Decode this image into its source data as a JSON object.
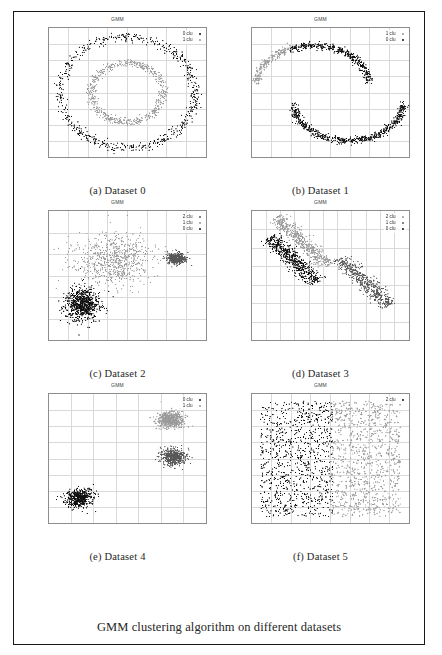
{
  "figure": {
    "caption": "GMM clustering algorithm on different datasets",
    "subplot_title": "GMM",
    "axis_label_x": "x",
    "axis_label_y": "y"
  },
  "subfigures": [
    {
      "caption": "(a) Dataset 0"
    },
    {
      "caption": "(b) Dataset 1"
    },
    {
      "caption": "(c) Dataset 2"
    },
    {
      "caption": "(d) Dataset 3"
    },
    {
      "caption": "(e) Dataset 4"
    },
    {
      "caption": "(f) Dataset 5"
    }
  ],
  "colors": {
    "cluster0": "#101010",
    "cluster1": "#9a9a9a",
    "cluster2": "#585858",
    "grid": "#d9d9d9",
    "frame": "#8d8d8d",
    "border": "#17171a",
    "text": "#262626"
  },
  "chart_data": [
    {
      "id": "a",
      "type": "scatter",
      "title": "GMM",
      "xlabel": "x",
      "ylabel": "y",
      "xlim": [
        -2,
        2
      ],
      "ylim": [
        -2,
        2
      ],
      "xticks": [
        "-2",
        "-1.5",
        "-1",
        "-0.5",
        "0",
        "0.5",
        "1",
        "1.5",
        "2"
      ],
      "yticks": [
        "-2",
        "-1.5",
        "-1",
        "-0.5",
        "0",
        "0.5",
        "1",
        "1.5",
        "2"
      ],
      "grid": true,
      "legend_position": "top-right",
      "shape": "concentric-circles",
      "series": [
        {
          "name": "0 clu",
          "color": "#101010",
          "n": 600,
          "radius": 1.72,
          "noise": 0.075,
          "marker": "dot"
        },
        {
          "name": "1 clu",
          "color": "#9a9a9a",
          "n": 600,
          "radius": 0.92,
          "noise": 0.062,
          "marker": "dot"
        }
      ]
    },
    {
      "id": "b",
      "type": "scatter",
      "title": "GMM",
      "xlabel": "x",
      "ylabel": "y",
      "xlim": [
        -2,
        2
      ],
      "ylim": [
        -2,
        2
      ],
      "xticks": [
        "-2",
        "-1.5",
        "-1",
        "-0.5",
        "0",
        "0.5",
        "1",
        "1.5",
        "2"
      ],
      "yticks": [
        "-2",
        "-1.5",
        "-1",
        "-0.5",
        "0",
        "0.5",
        "1",
        "1.5",
        "2"
      ],
      "grid": true,
      "legend_position": "top-right",
      "shape": "two-moons",
      "series": [
        {
          "name": "1 clu",
          "color": "#9a9a9a",
          "n": 230,
          "marker": "plus"
        },
        {
          "name": "0 clu",
          "color": "#101010",
          "n": 1000,
          "marker": "dot"
        }
      ]
    },
    {
      "id": "c",
      "type": "scatter",
      "title": "GMM",
      "xlabel": "x",
      "ylabel": "y",
      "xlim": [
        -2,
        2
      ],
      "ylim": [
        -3,
        3
      ],
      "xticks": [
        "-2",
        "-1.5",
        "-1",
        "-0.5",
        "0",
        "0.5",
        "1",
        "1.5",
        "2"
      ],
      "yticks": [
        "-3",
        "-2",
        "-1",
        "0",
        "1",
        "2",
        "3"
      ],
      "grid": true,
      "legend_position": "top-right",
      "shape": "three-blobs",
      "series": [
        {
          "name": "2 clu",
          "color": "#585858",
          "n": 420,
          "cx": 1.25,
          "cy": 0.78,
          "sx": 0.12,
          "sy": 0.13,
          "marker": "dot"
        },
        {
          "name": "1 clu",
          "color": "#9a9a9a",
          "n": 700,
          "cx": -0.35,
          "cy": 0.72,
          "sx": 0.52,
          "sy": 0.62,
          "marker": "dot"
        },
        {
          "name": "0 clu",
          "color": "#101010",
          "n": 750,
          "cx": -1.15,
          "cy": -1.35,
          "sx": 0.22,
          "sy": 0.38,
          "marker": "dot"
        }
      ]
    },
    {
      "id": "d",
      "type": "scatter",
      "title": "GMM",
      "xlabel": "x",
      "ylabel": "y",
      "xlim": [
        -2.5,
        3
      ],
      "ylim": [
        -4,
        3
      ],
      "xticks": [
        "-2.5",
        "-2",
        "-1.5",
        "-1",
        "-0.5",
        "0",
        "0.5",
        "1",
        "1.5",
        "2",
        "2.5",
        "3"
      ],
      "yticks": [
        "-4",
        "-3",
        "-2",
        "-1",
        "0",
        "1",
        "2",
        "3"
      ],
      "grid": true,
      "legend_position": "top-right",
      "shape": "anisotropic-bands",
      "series": [
        {
          "name": "2 clu",
          "color": "#9a9a9a",
          "n": 520,
          "cx": -0.75,
          "cy": 1.35,
          "len": 1.6,
          "slope": -1.45,
          "width": 0.16,
          "marker": "dot"
        },
        {
          "name": "1 clu",
          "color": "#585858",
          "n": 520,
          "cx": 1.45,
          "cy": -0.85,
          "len": 1.55,
          "slope": -1.45,
          "width": 0.17,
          "marker": "dot"
        },
        {
          "name": "0 clu",
          "color": "#101010",
          "n": 560,
          "cx": -1.05,
          "cy": 0.35,
          "len": 1.5,
          "slope": -1.45,
          "width": 0.17,
          "marker": "dot"
        }
      ]
    },
    {
      "id": "e",
      "type": "scatter",
      "title": "GMM",
      "xlabel": "x",
      "ylabel": "y",
      "xlim": [
        -2,
        1.5
      ],
      "ylim": [
        -2,
        2
      ],
      "xticks": [
        "-2",
        "-1.5",
        "-1",
        "-0.5",
        "0",
        "0.5",
        "1",
        "1.5"
      ],
      "yticks": [
        "-2",
        "-1.5",
        "-1",
        "-0.5",
        "0",
        "0.5",
        "1",
        "1.5",
        "2"
      ],
      "grid": true,
      "legend_position": "top-right",
      "shape": "three-tight-blobs",
      "series": [
        {
          "name": "0 clu",
          "color": "#101010",
          "n": 520,
          "cx": -1.32,
          "cy": -1.22,
          "sx": 0.145,
          "sy": 0.145,
          "marker": "dot"
        },
        {
          "name": "1 clu",
          "color": "#9a9a9a",
          "n": 520,
          "cx": 0.7,
          "cy": 1.2,
          "sx": 0.15,
          "sy": 0.125,
          "marker": "plus"
        },
        {
          "name": "1b",
          "color": "#585858",
          "n": 520,
          "cx": 0.78,
          "cy": 0.05,
          "sx": 0.135,
          "sy": 0.12,
          "marker": "dot",
          "hidden_from_legend": true
        }
      ]
    },
    {
      "id": "f",
      "type": "scatter",
      "title": "GMM",
      "xlabel": "x",
      "ylabel": "y",
      "xlim": [
        -2,
        2
      ],
      "ylim": [
        -2,
        2
      ],
      "xticks": [
        "-2",
        "-1.5",
        "-1",
        "-0.5",
        "0",
        "0.5",
        "1",
        "1.5",
        "2"
      ],
      "yticks": [
        "-2",
        "-1.5",
        "-1",
        "-0.5",
        "0",
        "0.5",
        "1",
        "1.5",
        "2"
      ],
      "grid": true,
      "legend_position": "top-right",
      "shape": "uniform-split",
      "series": [
        {
          "name": "2 clu",
          "color": "#101010",
          "n": 900,
          "xrange": [
            -1.78,
            0.05
          ],
          "yrange": [
            -1.8,
            1.78
          ],
          "marker": "dot"
        },
        {
          "name": "1 clu",
          "color": "#9a9a9a",
          "n": 900,
          "xrange": [
            0.0,
            1.78
          ],
          "yrange": [
            -1.8,
            1.78
          ],
          "marker": "plus",
          "hidden_from_legend": true
        }
      ]
    }
  ]
}
